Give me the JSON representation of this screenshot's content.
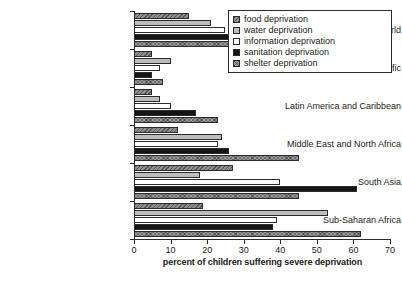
{
  "chart_data": {
    "type": "bar",
    "orientation": "horizontal",
    "title": "",
    "subtitle": "",
    "xlabel": "percent of children suffering severe deprivation",
    "ylabel": "",
    "xlim": [
      0,
      70
    ],
    "xticks": [
      0,
      10,
      20,
      30,
      40,
      50,
      60,
      70
    ],
    "grid": false,
    "legend_position": "top-right",
    "categories": [
      "developing world",
      "East Asia and Pacific",
      "Latin America and Caribbean",
      "Middle East and North Africa",
      "South Asia",
      "Sub-Saharan Africa"
    ],
    "series": [
      {
        "name": "food deprivation",
        "values": [
          15,
          5,
          5,
          12,
          27,
          19
        ]
      },
      {
        "name": "water deprivation",
        "values": [
          21,
          10,
          7,
          24,
          18,
          53
        ]
      },
      {
        "name": "information deprivation",
        "values": [
          25,
          7,
          10,
          23,
          40,
          39
        ]
      },
      {
        "name": "sanitation deprivation",
        "values": [
          31,
          5,
          17,
          26,
          61,
          38
        ]
      },
      {
        "name": "shelter deprivation",
        "values": [
          34,
          8,
          23,
          45,
          45,
          62
        ]
      }
    ]
  },
  "legend": {
    "items": [
      {
        "label": "food deprivation",
        "pattern": "p-food"
      },
      {
        "label": "water deprivation",
        "pattern": "p-water"
      },
      {
        "label": "information deprivation",
        "pattern": "p-info"
      },
      {
        "label": "sanitation deprivation",
        "pattern": "p-sani"
      },
      {
        "label": "shelter deprivation",
        "pattern": "p-shelter"
      }
    ]
  },
  "colors": {
    "axis": "#2b2b2b",
    "text": "#1a1a1a",
    "background": "#ffffff",
    "food": "#8e8e8e",
    "water": "#bdbdbd",
    "information": "#ffffff",
    "sanitation": "#151515",
    "shelter": "#9a9a9a"
  }
}
